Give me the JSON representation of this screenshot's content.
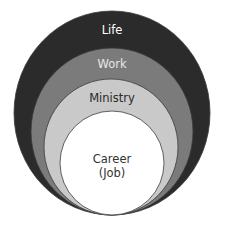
{
  "diagram": {
    "type": "nested-circles",
    "rings": [
      {
        "id": "life",
        "label": "Life",
        "fill": "#2b2b2b",
        "text_color": "#ffffff",
        "ellipse": {
          "cx": 112,
          "cy": 113,
          "rx": 98,
          "ry": 102
        },
        "label_pos": {
          "x": 112,
          "y": 30
        }
      },
      {
        "id": "work",
        "label": "Work",
        "fill": "#7b7b7b",
        "text_color": "#e8e8e8",
        "ellipse": {
          "cx": 112,
          "cy": 131.5,
          "rx": 81,
          "ry": 83.5
        },
        "label_pos": {
          "x": 112,
          "y": 64
        }
      },
      {
        "id": "ministry",
        "label": "Ministry",
        "fill": "#c9c9c9",
        "text_color": "#2a2a2a",
        "ellipse": {
          "cx": 111,
          "cy": 147,
          "rx": 67,
          "ry": 68
        },
        "label_pos": {
          "x": 112,
          "y": 98
        }
      },
      {
        "id": "career",
        "label": "Career",
        "sublabel": "(Job)",
        "fill": "#ffffff",
        "text_color": "#333333",
        "ellipse": {
          "cx": 112,
          "cy": 163,
          "rx": 52,
          "ry": 52
        },
        "label_pos": {
          "x": 112,
          "y": 159
        },
        "sublabel_pos": {
          "x": 112,
          "y": 173
        }
      }
    ],
    "outline_color": "#3a3a3a"
  }
}
